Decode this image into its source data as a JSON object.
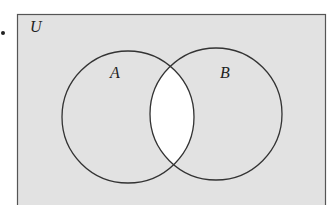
{
  "diagram": {
    "type": "venn",
    "universe_label": "U",
    "sets": [
      {
        "label": "A",
        "cx": 128,
        "cy": 117,
        "r": 66
      },
      {
        "label": "B",
        "cx": 216,
        "cy": 114,
        "r": 66
      }
    ],
    "shaded_region": "complement of A ∩ B",
    "unshaded_region": "A ∩ B",
    "colors": {
      "shade": "#e2e2e2",
      "unshaded": "#ffffff",
      "stroke": "#333333"
    }
  }
}
